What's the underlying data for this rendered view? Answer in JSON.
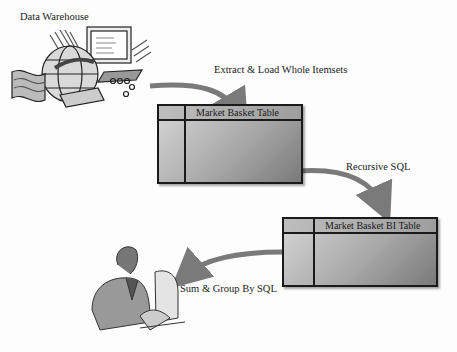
{
  "diagram": {
    "nodes": [
      {
        "id": "data-warehouse",
        "label": "Data Warehouse",
        "icon": "globe-computer-clipart"
      },
      {
        "id": "market-basket-table",
        "label": "Market Basket Table",
        "shape": "table"
      },
      {
        "id": "market-basket-bi-table",
        "label": "Market Basket  BI Table",
        "shape": "table"
      },
      {
        "id": "analyst",
        "label": "",
        "icon": "person-at-computer-clipart"
      }
    ],
    "edges": [
      {
        "from": "data-warehouse",
        "to": "market-basket-table",
        "label": "Extract & Load Whole Itemsets"
      },
      {
        "from": "market-basket-table",
        "to": "market-basket-bi-table",
        "label": "Recursive SQL"
      },
      {
        "from": "market-basket-bi-table",
        "to": "analyst",
        "label": "Sum & Group By SQL"
      }
    ],
    "colors": {
      "arrow": "#7a7a7a",
      "table_border": "#1a1a1a",
      "table_fill_light": "#d6d6d6",
      "table_fill_dark": "#7a7a7a"
    }
  }
}
